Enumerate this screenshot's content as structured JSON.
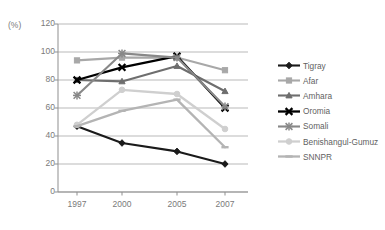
{
  "chart_data": {
    "type": "line",
    "title": "",
    "xlabel": "",
    "ylabel": "(%)",
    "categories": [
      "1997",
      "2000",
      "2005",
      "2007"
    ],
    "ylim": [
      0,
      120
    ],
    "yticks": [
      0,
      20,
      40,
      60,
      80,
      100,
      120
    ],
    "grid": true,
    "legend_position": "right",
    "series": [
      {
        "name": "Tigray",
        "values": [
          47,
          35,
          29,
          20
        ],
        "color": "#1a1a1a",
        "marker": "diamond",
        "width": 2.1
      },
      {
        "name": "Afar",
        "values": [
          94,
          96,
          96,
          87
        ],
        "color": "#a8a8a8",
        "marker": "square",
        "width": 2.1
      },
      {
        "name": "Amhara",
        "values": [
          80,
          79,
          90,
          72
        ],
        "color": "#6e6e6e",
        "marker": "triangle",
        "width": 2.1
      },
      {
        "name": "Oromia",
        "values": [
          80,
          89,
          97,
          60
        ],
        "color": "#000000",
        "marker": "cross",
        "width": 2.3
      },
      {
        "name": "Somali",
        "values": [
          69,
          99,
          96,
          61
        ],
        "color": "#888888",
        "marker": "star",
        "width": 2.1
      },
      {
        "name": "Benishangul-Gumuz",
        "values": [
          48,
          73,
          70,
          45
        ],
        "color": "#cfcfcf",
        "marker": "circle",
        "width": 2.3
      },
      {
        "name": "SNNPR",
        "values": [
          47,
          58,
          66,
          32
        ],
        "color": "#b4b4b4",
        "marker": "dash",
        "width": 2.3
      }
    ]
  },
  "axis": {
    "unit_label": "(%)",
    "y_tick_labels": [
      "120",
      "100",
      "80",
      "60",
      "40",
      "20",
      "0"
    ],
    "x_tick_labels": [
      "1997",
      "2000",
      "2005",
      "2007"
    ]
  },
  "legend": {
    "items": [
      {
        "label": "Tigray"
      },
      {
        "label": "Afar"
      },
      {
        "label": "Amhara"
      },
      {
        "label": "Oromia"
      },
      {
        "label": "Somali"
      },
      {
        "label": "Benishangul-Gumuz"
      },
      {
        "label": "SNNPR"
      }
    ]
  },
  "colors": {
    "grid": "#b9b9b9",
    "axis": "#8f8f8f",
    "text": "#7a7a7a"
  }
}
